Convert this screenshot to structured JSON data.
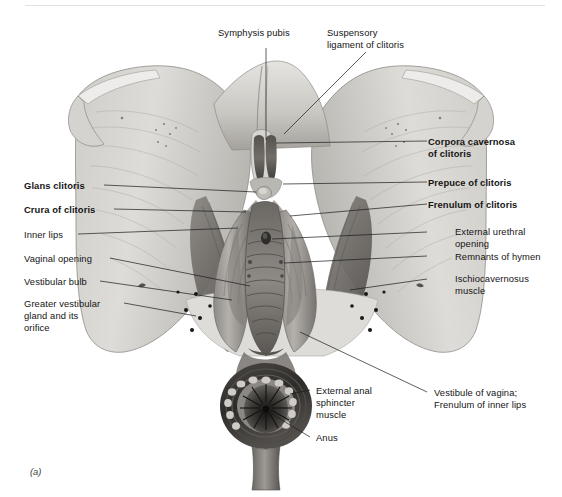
{
  "figure": {
    "caption": "(a)",
    "title_visible": false,
    "style": "grayscale anatomical illustration, female external genitalia, deep dissection view",
    "colors": {
      "background": "#ffffff",
      "text": "#141414",
      "leader_line": "#1a1a1a",
      "top_rule": "#e2e2e2",
      "tissue_light": "#d8d6d2",
      "tissue_mid": "#a8a5a0",
      "tissue_dark": "#6d6a66",
      "tissue_darkest": "#3b3937"
    }
  },
  "labels": {
    "top": [
      {
        "id": "symphysis-pubis",
        "text": "Symphysis pubis",
        "bold": false
      },
      {
        "id": "suspensory-ligament-of-clitoris",
        "line1": "Suspensory",
        "line2": "ligament of clitoris",
        "bold": false
      }
    ],
    "left": [
      {
        "id": "glans-clitoris",
        "text": "Glans clitoris",
        "bold": true
      },
      {
        "id": "crura-of-clitoris",
        "text": "Crura of clitoris",
        "bold": true
      },
      {
        "id": "inner-lips",
        "text": "Inner lips",
        "bold": false
      },
      {
        "id": "vaginal-opening",
        "text": "Vaginal opening",
        "bold": false
      },
      {
        "id": "vestibular-bulb",
        "text": "Vestibular bulb",
        "bold": false
      },
      {
        "id": "greater-vestibular-gland",
        "line1": "Greater vestibular",
        "line2": "gland and its",
        "line3": "orifice",
        "bold": false
      }
    ],
    "right": [
      {
        "id": "corpora-cavernosa-of-clitoris",
        "line1": "Corpora cavernosa",
        "line2": "of clitoris",
        "bold": true
      },
      {
        "id": "prepuce-of-clitoris",
        "text": "Prepuce of clitoris",
        "bold": true
      },
      {
        "id": "frenulum-of-clitoris",
        "text": "Frenulum of clitoris",
        "bold": true
      },
      {
        "id": "external-urethral-opening",
        "line1": "External urethral",
        "line2": "opening",
        "bold": false
      },
      {
        "id": "remnants-of-hymen",
        "text": "Remnants of hymen",
        "bold": false
      },
      {
        "id": "ischiocavernosus-muscle",
        "line1": "Ischiocavernosus",
        "line2": "muscle",
        "bold": false
      },
      {
        "id": "vestibule-of-vagina",
        "line1": "Vestibule of vagina;",
        "line2": "Frenulum of inner lips",
        "bold": false
      }
    ],
    "bottom": [
      {
        "id": "external-anal-sphincter-muscle",
        "line1": "External anal",
        "line2": "sphincter",
        "line3": "muscle",
        "bold": false
      },
      {
        "id": "anus",
        "text": "Anus",
        "bold": false
      }
    ]
  }
}
